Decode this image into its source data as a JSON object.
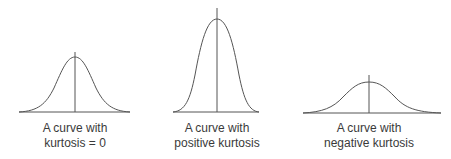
{
  "diagram": {
    "line_color": "#555555",
    "panels": [
      {
        "id": "zero",
        "caption_line1": "A curve with",
        "caption_line2": "kurtosis = 0"
      },
      {
        "id": "positive",
        "caption_line1": "A curve with",
        "caption_line2": "positive kurtosis"
      },
      {
        "id": "negative",
        "caption_line1": "A curve with",
        "caption_line2": "negative kurtosis"
      }
    ]
  }
}
